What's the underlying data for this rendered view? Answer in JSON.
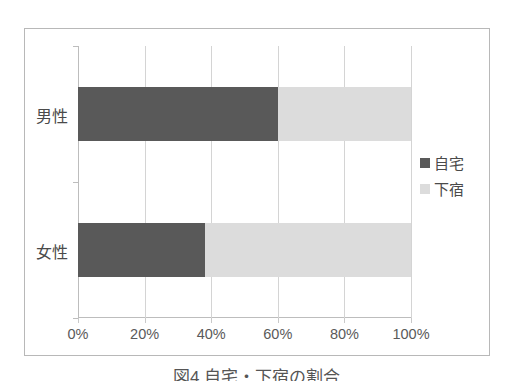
{
  "figure": {
    "caption": "図4 自宅・下宿の割合"
  },
  "legend": {
    "position": "right",
    "items": [
      {
        "label": "自宅",
        "color": "#595959",
        "icon": "legend-swatch-dark"
      },
      {
        "label": "下宿",
        "color": "#dcdcdc",
        "icon": "legend-swatch-light"
      }
    ]
  },
  "chart_data": {
    "type": "bar",
    "orientation": "horizontal",
    "stacked": true,
    "normalized": true,
    "title": "",
    "xlabel": "",
    "ylabel": "",
    "categories": [
      "男性",
      "女性"
    ],
    "xtick_labels": [
      "0%",
      "20%",
      "40%",
      "60%",
      "80%",
      "100%"
    ],
    "xticks": [
      0,
      20,
      40,
      60,
      80,
      100
    ],
    "xlim": [
      0,
      100
    ],
    "grid": true,
    "series": [
      {
        "name": "自宅",
        "color": "#595959",
        "values": [
          60,
          38
        ]
      },
      {
        "name": "下宿",
        "color": "#dcdcdc",
        "values": [
          40,
          62
        ]
      }
    ]
  },
  "colors": {
    "dark": "#595959",
    "light": "#dcdcdc",
    "gridline": "#d4d4d4",
    "axis": "#bdbdbd",
    "frame": "#b8b8b8",
    "text": "#4a4a4a",
    "background": "#ffffff"
  }
}
